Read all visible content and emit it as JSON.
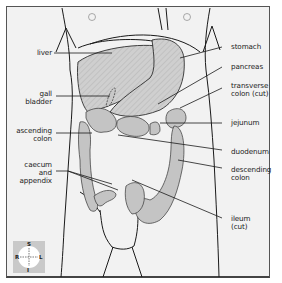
{
  "diagram": {
    "type": "anatomical-illustration",
    "labels_left": [
      {
        "id": "liver",
        "text": "liver"
      },
      {
        "id": "gall-bladder",
        "text": "gall\nbladder"
      },
      {
        "id": "ascending-colon",
        "text": "ascending\ncolon"
      },
      {
        "id": "caecum-appendix",
        "text": "caecum\nand\nappendix"
      }
    ],
    "labels_right": [
      {
        "id": "stomach",
        "text": "stomach"
      },
      {
        "id": "pancreas",
        "text": "pancreas"
      },
      {
        "id": "transverse-colon",
        "text": "transverse\ncolon (cut)"
      },
      {
        "id": "jejunum",
        "text": "jejunum"
      },
      {
        "id": "duodenum",
        "text": "duodenum"
      },
      {
        "id": "descending-colon",
        "text": "descending\ncolon"
      },
      {
        "id": "ileum",
        "text": "ileum\n(cut)"
      }
    ],
    "compass": {
      "top": "S",
      "bottom": "I",
      "left": "R",
      "right": "L"
    },
    "colors": {
      "background": "#f2f2f2",
      "organ_fill": "#c8c8c8",
      "line": "#1a1a1a",
      "compass_bg": "#c9c9c9"
    }
  }
}
